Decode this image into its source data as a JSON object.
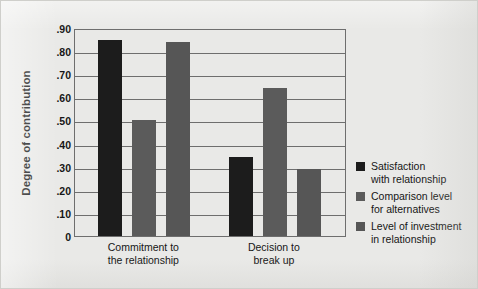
{
  "chart_data": {
    "type": "bar",
    "title": "",
    "xlabel": "",
    "ylabel": "Degree of contribution",
    "ylim": [
      0,
      0.9
    ],
    "grid": true,
    "legend_position": "right",
    "categories": [
      "Commitment to the relationship",
      "Decision to break up"
    ],
    "category_lines": [
      [
        "Commitment to",
        "the relationship"
      ],
      [
        "Decision to",
        "break up"
      ]
    ],
    "ytick_labels": [
      ".90",
      ".80",
      ".70",
      ".60",
      ".50",
      ".40",
      ".30",
      ".20",
      ".10",
      "0"
    ],
    "ytick_values": [
      0.9,
      0.8,
      0.7,
      0.6,
      0.5,
      0.4,
      0.3,
      0.2,
      0.1,
      0
    ],
    "series": [
      {
        "name": "Satisfaction with relationship",
        "name_lines": [
          "Satisfaction",
          "with relationship"
        ],
        "color": "#1c1c1c",
        "values": [
          0.85,
          0.34
        ]
      },
      {
        "name": "Comparison level for alternatives",
        "name_lines": [
          "Comparison level",
          "for alternatives"
        ],
        "color": "#5b5b5b",
        "values": [
          0.5,
          0.64
        ]
      },
      {
        "name": "Level of investment in relationship",
        "name_lines": [
          "Level of investment",
          "in relationship"
        ],
        "color": "#565656",
        "values": [
          0.84,
          0.29
        ]
      }
    ]
  },
  "colors": {
    "background": "#e9e9e7",
    "axis": "#6e6e6e",
    "text": "#161616"
  }
}
